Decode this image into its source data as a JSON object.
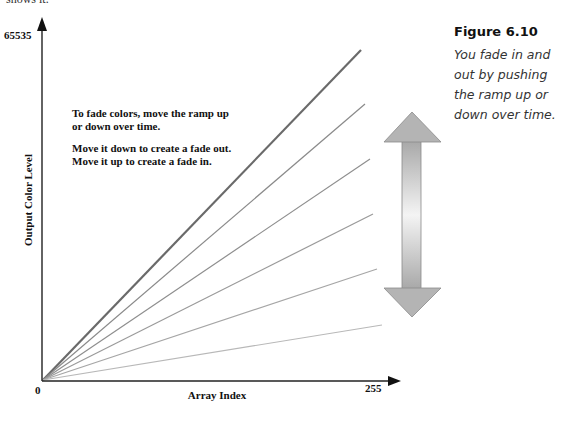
{
  "page_fragment": "shows it.",
  "figure": {
    "label": "Figure 6.10",
    "caption": "You fade in and out by pushing the ramp up or down over time."
  },
  "diagram": {
    "y_axis": {
      "label": "Output Color Level",
      "max_tick": "65535"
    },
    "x_axis": {
      "label": "Array Index",
      "max_tick": "255"
    },
    "origin_label": "0",
    "annotation_1_line1": "To fade colors, move the ramp up",
    "annotation_1_line2": "or down over time.",
    "annotation_2_line1": "Move it down to create a fade out.",
    "annotation_2_line2": "Move it up to create a fade in.",
    "ramps": [
      {
        "end": [
          361,
          50
        ],
        "color": "#6a6a6a",
        "width": 2.2
      },
      {
        "end": [
          365,
          104
        ],
        "color": "#8a8a8a",
        "width": 1.2
      },
      {
        "end": [
          370,
          159
        ],
        "color": "#8e8e8e",
        "width": 1.2
      },
      {
        "end": [
          373,
          214
        ],
        "color": "#9a9a9a",
        "width": 1.2
      },
      {
        "end": [
          377,
          269
        ],
        "color": "#a6a6a6",
        "width": 1.2
      },
      {
        "end": [
          382,
          325
        ],
        "color": "#b8b8b8",
        "width": 1.2
      }
    ],
    "double_arrow": {
      "meaning": "move ramp up or down"
    }
  }
}
